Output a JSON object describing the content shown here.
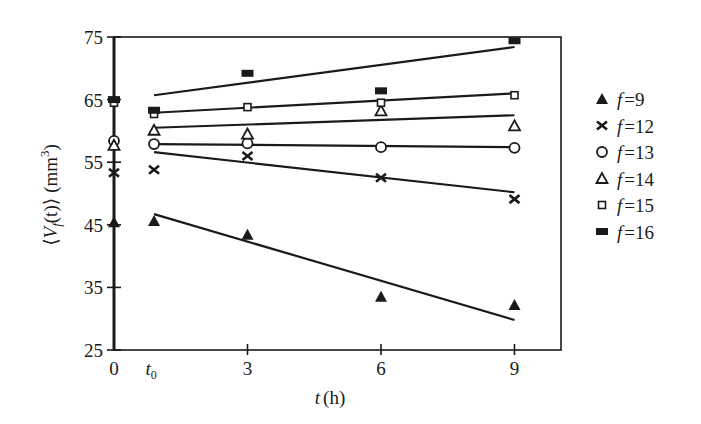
{
  "chart_data": {
    "type": "scatter",
    "title": "",
    "xlabel": "t (h)",
    "xlabel_var": "t",
    "xlabel_unit": "(h)",
    "ylabel": "⟨V_f(t)⟩ (mm³)",
    "ylabel_parts": {
      "open": "⟨",
      "var": "V",
      "sub": "f",
      "arg": "(t)",
      "close": "⟩",
      "unit": "(mm",
      "sup": "3",
      "unit_close": ")"
    },
    "xlim": [
      0,
      10.5
    ],
    "ylim": [
      25,
      75
    ],
    "x_ticks": [
      {
        "value": 0,
        "label": "0"
      },
      {
        "value": 0.9,
        "label": "t",
        "sub": "0"
      },
      {
        "value": 3,
        "label": "3"
      },
      {
        "value": 6,
        "label": "6"
      },
      {
        "value": 9,
        "label": "9"
      }
    ],
    "y_ticks": [
      {
        "value": 25,
        "label": "25"
      },
      {
        "value": 35,
        "label": "35"
      },
      {
        "value": 45,
        "label": "45"
      },
      {
        "value": 55,
        "label": "55"
      },
      {
        "value": 65,
        "label": "65"
      },
      {
        "value": 75,
        "label": "75"
      }
    ],
    "grid": false,
    "legend_position": "right",
    "x": [
      0,
      0.9,
      3,
      6,
      9
    ],
    "series": [
      {
        "name": "f=9",
        "label_var": "f",
        "label_val": "=9",
        "marker": "filled-triangle",
        "values": [
          45.4,
          45.6,
          43.4,
          33.5,
          32.2
        ],
        "fit": {
          "x": [
            0.9,
            9
          ],
          "y": [
            46.7,
            29.8
          ]
        }
      },
      {
        "name": "f=12",
        "label_var": "f",
        "label_val": "=12",
        "marker": "x-cross",
        "values": [
          53.3,
          53.8,
          56.0,
          52.5,
          49.1
        ],
        "fit": {
          "x": [
            0.9,
            9
          ],
          "y": [
            56.6,
            50.2
          ]
        }
      },
      {
        "name": "f=13",
        "label_var": "f",
        "label_val": "=13",
        "marker": "open-circle",
        "values": [
          58.4,
          57.9,
          58.0,
          57.4,
          57.3
        ],
        "fit": {
          "x": [
            0.9,
            9
          ],
          "y": [
            57.9,
            57.4
          ]
        }
      },
      {
        "name": "f=14",
        "label_var": "f",
        "label_val": "=14",
        "marker": "open-triangle",
        "values": [
          57.7,
          60.1,
          59.5,
          63.2,
          60.8
        ],
        "fit": {
          "x": [
            0.9,
            9
          ],
          "y": [
            60.5,
            62.5
          ]
        }
      },
      {
        "name": "f=15",
        "label_var": "f",
        "label_val": "=15",
        "marker": "open-square",
        "values": [
          64.5,
          62.7,
          63.8,
          64.5,
          65.7
        ],
        "fit": {
          "x": [
            0.9,
            9
          ],
          "y": [
            62.9,
            66.0
          ]
        }
      },
      {
        "name": "f=16",
        "label_var": "f",
        "label_val": "=16",
        "marker": "filled-rect",
        "values": [
          65.0,
          63.3,
          69.2,
          66.4,
          74.4
        ],
        "fit": {
          "x": [
            0.9,
            9
          ],
          "y": [
            65.7,
            73.4
          ]
        }
      }
    ]
  },
  "colors": {
    "ink": "#1a1a1a",
    "background": "#ffffff"
  }
}
